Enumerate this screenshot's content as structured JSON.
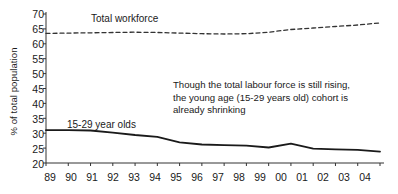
{
  "chart_data": {
    "type": "line",
    "title": "",
    "xlabel": "",
    "ylabel": "% of total population",
    "ylim": [
      20,
      70
    ],
    "yticks": [
      20,
      25,
      30,
      35,
      40,
      45,
      50,
      55,
      60,
      65,
      70
    ],
    "grid": false,
    "legend_position": "inline-labels",
    "categories": [
      "89",
      "90",
      "91",
      "92",
      "93",
      "94",
      "95",
      "96",
      "97",
      "98",
      "99",
      "00",
      "01",
      "02",
      "03",
      "04"
    ],
    "series": [
      {
        "name": "Total workforce",
        "style": "dashed",
        "color": "#333333",
        "values": [
          63.5,
          63.6,
          63.7,
          63.8,
          63.9,
          63.8,
          63.6,
          63.4,
          63.3,
          63.4,
          63.9,
          64.8,
          65.3,
          65.8,
          66.3,
          67.0
        ]
      },
      {
        "name": "15-29 year olds",
        "style": "solid",
        "color": "#1a1a1a",
        "values": [
          31.0,
          31.0,
          30.9,
          30.2,
          29.4,
          28.8,
          26.9,
          26.2,
          26.0,
          25.8,
          25.2,
          26.5,
          24.8,
          24.6,
          24.4,
          23.8
        ]
      }
    ],
    "annotations": [
      {
        "name": "commentary",
        "lines": [
          "Though the total labour force is still rising,",
          "the young age (15-29 years old) cohort is",
          "already shrinking"
        ]
      }
    ],
    "inline_labels": [
      {
        "name": "total-workforce-label",
        "text": "Total workforce"
      },
      {
        "name": "young-cohort-label",
        "text": "15-29 year olds"
      }
    ]
  }
}
